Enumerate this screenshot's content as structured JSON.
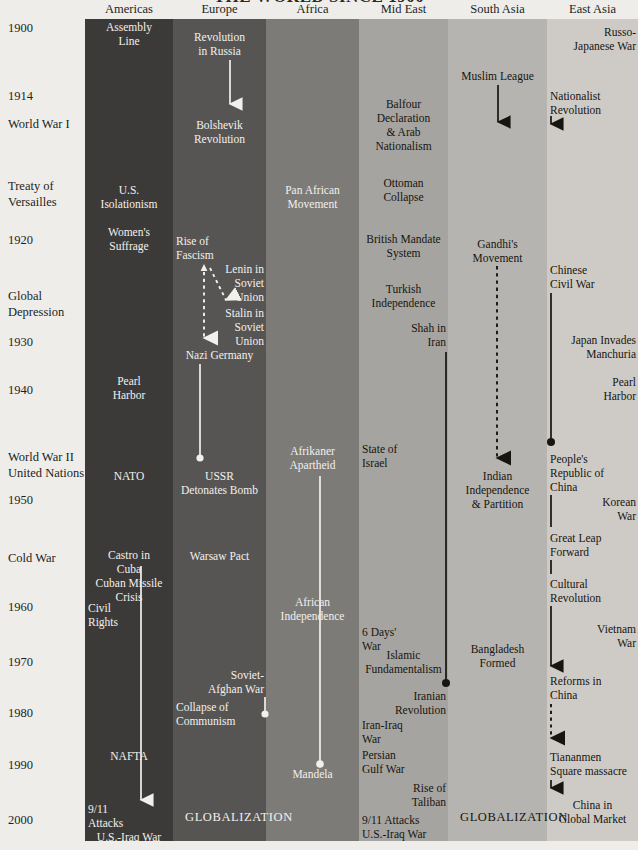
{
  "title": "THE WORLD SINCE 1900",
  "chart_data": {
    "type": "table",
    "title": "THE WORLD SINCE 1900",
    "xlabel": "Region",
    "ylabel": "Year",
    "ylim": [
      1900,
      2005
    ],
    "grid": false,
    "legend": "none",
    "categories": [
      "Americas",
      "Europe",
      "Africa",
      "Mid East",
      "South Asia",
      "East Asia"
    ],
    "band_colors": [
      "#3c3a38",
      "#575553",
      "#7d7b78",
      "#a6a4a0",
      "#b6b4b0",
      "#cecbc7"
    ]
  },
  "axis": {
    "ticks": [
      {
        "label": "1900",
        "y": 28
      },
      {
        "label": "1914",
        "y": 96
      },
      {
        "label": "World War I",
        "y": 124
      },
      {
        "label": "Treaty of",
        "y": 186
      },
      {
        "label": "Versailles",
        "y": 202
      },
      {
        "label": "1920",
        "y": 240
      },
      {
        "label": "Global",
        "y": 296
      },
      {
        "label": "Depression",
        "y": 312
      },
      {
        "label": "1930",
        "y": 342
      },
      {
        "label": "1940",
        "y": 390
      },
      {
        "label": "World War II",
        "y": 457
      },
      {
        "label": "United Nations",
        "y": 473
      },
      {
        "label": "1950",
        "y": 500
      },
      {
        "label": "Cold War",
        "y": 558
      },
      {
        "label": "1960",
        "y": 607
      },
      {
        "label": "1970",
        "y": 662
      },
      {
        "label": "1980",
        "y": 713
      },
      {
        "label": "1990",
        "y": 765
      },
      {
        "label": "2000",
        "y": 820
      }
    ]
  },
  "columns": [
    {
      "name": "Americas",
      "header": "Americas",
      "events": [
        {
          "text": "Assembly",
          "y": 28,
          "align": "c"
        },
        {
          "text": "Line",
          "y": 42,
          "align": "c"
        },
        {
          "text": "U.S.",
          "y": 191,
          "align": "c"
        },
        {
          "text": "Isolationism",
          "y": 205,
          "align": "c"
        },
        {
          "text": "Women's",
          "y": 233,
          "align": "c"
        },
        {
          "text": "Suffrage",
          "y": 247,
          "align": "c"
        },
        {
          "text": "Pearl",
          "y": 382,
          "align": "c"
        },
        {
          "text": "Harbor",
          "y": 396,
          "align": "c"
        },
        {
          "text": "NATO",
          "y": 477,
          "align": "c"
        },
        {
          "text": "Castro in",
          "y": 556,
          "align": "c"
        },
        {
          "text": "Cuba",
          "y": 570,
          "align": "c"
        },
        {
          "text": "Cuban Missile",
          "y": 584,
          "align": "c"
        },
        {
          "text": "Crisis",
          "y": 598,
          "align": "c"
        },
        {
          "text": "Civil",
          "y": 609,
          "align": "l"
        },
        {
          "text": "Rights",
          "y": 623,
          "align": "l"
        },
        {
          "text": "NAFTA",
          "y": 757,
          "align": "c"
        },
        {
          "text": "9/11",
          "y": 810,
          "align": "l"
        },
        {
          "text": "Attacks",
          "y": 824,
          "align": "l"
        },
        {
          "text": "U.S.-Iraq War",
          "y": 838,
          "align": "c"
        }
      ]
    },
    {
      "name": "Europe",
      "header": "Europe",
      "events": [
        {
          "text": "Revolution",
          "y": 38,
          "align": "c"
        },
        {
          "text": "in Russia",
          "y": 52,
          "align": "c"
        },
        {
          "text": "Bolshevik",
          "y": 126,
          "align": "c"
        },
        {
          "text": "Revolution",
          "y": 140,
          "align": "c"
        },
        {
          "text": "Rise of",
          "y": 242,
          "align": "l"
        },
        {
          "text": "Fascism",
          "y": 256,
          "align": "l"
        },
        {
          "text": "Lenin in",
          "y": 270,
          "align": "r"
        },
        {
          "text": "Soviet",
          "y": 284,
          "align": "r"
        },
        {
          "text": "Union",
          "y": 298,
          "align": "r"
        },
        {
          "text": "Stalin in",
          "y": 314,
          "align": "r"
        },
        {
          "text": "Soviet",
          "y": 328,
          "align": "r"
        },
        {
          "text": "Union",
          "y": 342,
          "align": "r"
        },
        {
          "text": "Nazi Germany",
          "y": 356,
          "align": "c"
        },
        {
          "text": "USSR",
          "y": 477,
          "align": "c"
        },
        {
          "text": "Detonates Bomb",
          "y": 491,
          "align": "c"
        },
        {
          "text": "Warsaw Pact",
          "y": 557,
          "align": "c"
        },
        {
          "text": "Soviet-",
          "y": 676,
          "align": "r"
        },
        {
          "text": "Afghan War",
          "y": 690,
          "align": "r"
        },
        {
          "text": "Collapse of",
          "y": 708,
          "align": "l"
        },
        {
          "text": "Communism",
          "y": 722,
          "align": "l"
        },
        {
          "text": "GLOBALIZATION",
          "y": 818,
          "align": "g"
        }
      ]
    },
    {
      "name": "Africa",
      "header": "Africa",
      "events": [
        {
          "text": "Pan African",
          "y": 191,
          "align": "c"
        },
        {
          "text": "Movement",
          "y": 205,
          "align": "c"
        },
        {
          "text": "Afrikaner",
          "y": 452,
          "align": "c"
        },
        {
          "text": "Apartheid",
          "y": 466,
          "align": "c"
        },
        {
          "text": "African",
          "y": 603,
          "align": "c"
        },
        {
          "text": "Independence",
          "y": 617,
          "align": "c"
        },
        {
          "text": "Mandela",
          "y": 775,
          "align": "c"
        }
      ]
    },
    {
      "name": "Mid East",
      "header": "Mid East",
      "events": [
        {
          "text": "Balfour",
          "y": 105,
          "align": "c"
        },
        {
          "text": "Declaration",
          "y": 119,
          "align": "c"
        },
        {
          "text": "& Arab",
          "y": 133,
          "align": "c"
        },
        {
          "text": "Nationalism",
          "y": 147,
          "align": "c"
        },
        {
          "text": "Ottoman",
          "y": 184,
          "align": "c"
        },
        {
          "text": "Collapse",
          "y": 198,
          "align": "c"
        },
        {
          "text": "British Mandate",
          "y": 240,
          "align": "c"
        },
        {
          "text": "System",
          "y": 254,
          "align": "c"
        },
        {
          "text": "Turkish",
          "y": 290,
          "align": "c"
        },
        {
          "text": "Independence",
          "y": 304,
          "align": "c"
        },
        {
          "text": "Shah in",
          "y": 329,
          "align": "r"
        },
        {
          "text": "Iran",
          "y": 343,
          "align": "r"
        },
        {
          "text": "State of",
          "y": 450,
          "align": "l"
        },
        {
          "text": "Israel",
          "y": 464,
          "align": "l"
        },
        {
          "text": "6 Days'",
          "y": 633,
          "align": "l"
        },
        {
          "text": "War",
          "y": 647,
          "align": "l"
        },
        {
          "text": "Islamic",
          "y": 656,
          "align": "c"
        },
        {
          "text": "Fundamentalism",
          "y": 670,
          "align": "c"
        },
        {
          "text": "Iranian",
          "y": 697,
          "align": "r"
        },
        {
          "text": "Revolution",
          "y": 711,
          "align": "r"
        },
        {
          "text": "Iran-Iraq",
          "y": 726,
          "align": "l"
        },
        {
          "text": "War",
          "y": 740,
          "align": "l"
        },
        {
          "text": "Persian",
          "y": 756,
          "align": "l"
        },
        {
          "text": "Gulf War",
          "y": 770,
          "align": "l"
        },
        {
          "text": "Rise of",
          "y": 789,
          "align": "r"
        },
        {
          "text": "Taliban",
          "y": 803,
          "align": "r"
        },
        {
          "text": "9/11 Attacks",
          "y": 821,
          "align": "l"
        },
        {
          "text": "U.S.-Iraq War",
          "y": 835,
          "align": "l"
        }
      ]
    },
    {
      "name": "South Asia",
      "header": "South Asia",
      "events": [
        {
          "text": "Muslim League",
          "y": 77,
          "align": "c"
        },
        {
          "text": "Gandhi's",
          "y": 245,
          "align": "c"
        },
        {
          "text": "Movement",
          "y": 259,
          "align": "c"
        },
        {
          "text": "Indian",
          "y": 477,
          "align": "c"
        },
        {
          "text": "Independence",
          "y": 491,
          "align": "c"
        },
        {
          "text": "& Partition",
          "y": 505,
          "align": "c"
        },
        {
          "text": "Bangladesh",
          "y": 650,
          "align": "c"
        },
        {
          "text": "Formed",
          "y": 664,
          "align": "c"
        },
        {
          "text": "GLOBALIZATION",
          "y": 818,
          "align": "g"
        }
      ]
    },
    {
      "name": "East Asia",
      "header": "East Asia",
      "events": [
        {
          "text": "Russo-",
          "y": 33,
          "align": "r"
        },
        {
          "text": "Japanese War",
          "y": 47,
          "align": "r"
        },
        {
          "text": "Nationalist",
          "y": 97,
          "align": "l"
        },
        {
          "text": "Revolution",
          "y": 111,
          "align": "l"
        },
        {
          "text": "Chinese",
          "y": 271,
          "align": "l"
        },
        {
          "text": "Civil War",
          "y": 285,
          "align": "l"
        },
        {
          "text": "Japan Invades",
          "y": 341,
          "align": "r"
        },
        {
          "text": "Manchuria",
          "y": 355,
          "align": "r"
        },
        {
          "text": "Pearl",
          "y": 383,
          "align": "r"
        },
        {
          "text": "Harbor",
          "y": 397,
          "align": "r"
        },
        {
          "text": "People's",
          "y": 460,
          "align": "l"
        },
        {
          "text": "Republic of",
          "y": 474,
          "align": "l"
        },
        {
          "text": "China",
          "y": 488,
          "align": "l"
        },
        {
          "text": "Korean",
          "y": 503,
          "align": "r"
        },
        {
          "text": "War",
          "y": 517,
          "align": "r"
        },
        {
          "text": "Great Leap",
          "y": 539,
          "align": "l"
        },
        {
          "text": "Forward",
          "y": 553,
          "align": "l"
        },
        {
          "text": "Cultural",
          "y": 585,
          "align": "l"
        },
        {
          "text": "Revolution",
          "y": 599,
          "align": "l"
        },
        {
          "text": "Vietnam",
          "y": 630,
          "align": "r"
        },
        {
          "text": "War",
          "y": 644,
          "align": "r"
        },
        {
          "text": "Reforms in",
          "y": 682,
          "align": "l"
        },
        {
          "text": "China",
          "y": 696,
          "align": "l"
        },
        {
          "text": "Tiananmen",
          "y": 758,
          "align": "l"
        },
        {
          "text": "Square massacre",
          "y": 772,
          "align": "l"
        },
        {
          "text": "China in",
          "y": 806,
          "align": "c"
        },
        {
          "text": "Global Market",
          "y": 820,
          "align": "c"
        }
      ]
    }
  ],
  "connectors": [
    {
      "region": "Europe",
      "kind": "solid-arrow-down",
      "label": "revolution-to-bolshevik"
    },
    {
      "region": "Europe",
      "kind": "dashed-arrow-down",
      "label": "fascism-to-nazi-germany"
    },
    {
      "region": "Europe",
      "kind": "dashed-arrow-diagonal",
      "label": "lenin-to-stalin"
    },
    {
      "region": "Europe",
      "kind": "solid-line-dot",
      "label": "nazi-germany-to-ussr-bomb"
    },
    {
      "region": "Europe",
      "kind": "solid-line-dot",
      "label": "soviet-afghan-to-collapse"
    },
    {
      "region": "Africa",
      "kind": "solid-line-dot",
      "label": "apartheid-to-mandela"
    },
    {
      "region": "Mid East",
      "kind": "solid-line-dot",
      "label": "shah-to-iranian-revolution"
    },
    {
      "region": "South Asia",
      "kind": "solid-arrow-down",
      "label": "muslim-league-arrow"
    },
    {
      "region": "South Asia",
      "kind": "dashed-arrow-down",
      "label": "gandhi-to-independence"
    },
    {
      "region": "East Asia",
      "kind": "solid-arrow-down",
      "label": "nationalist-revolution-arrow"
    },
    {
      "region": "East Asia",
      "kind": "solid-line-dot",
      "label": "civil-war-to-prc"
    },
    {
      "region": "East Asia",
      "kind": "solid-arrow-down",
      "label": "prc-to-reforms"
    },
    {
      "region": "East Asia",
      "kind": "dashed-arrow-down",
      "label": "reforms-to-tiananmen"
    },
    {
      "region": "East Asia",
      "kind": "solid-arrow-down",
      "label": "tiananmen-to-global-market"
    },
    {
      "region": "Americas",
      "kind": "solid-arrow-down",
      "label": "castro-to-911"
    }
  ]
}
